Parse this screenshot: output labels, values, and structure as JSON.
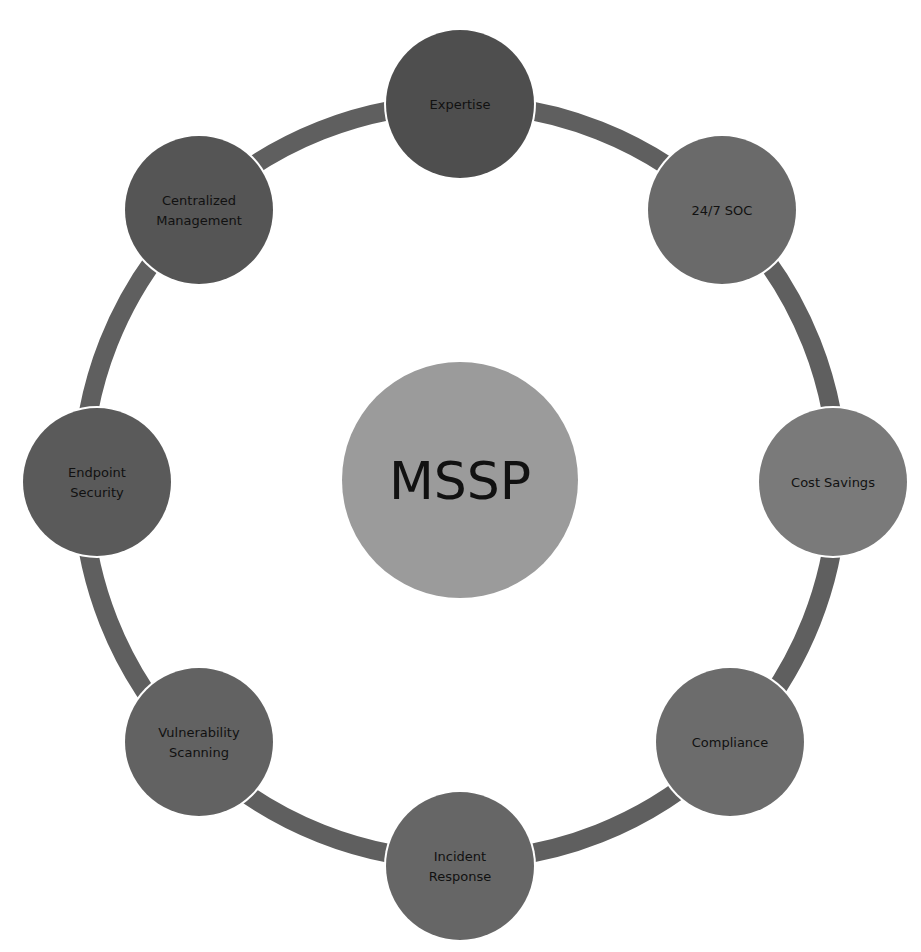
{
  "diagram": {
    "type": "hub-and-ring",
    "center": {
      "label": "MSSP",
      "color": "#9b9b9b"
    },
    "ring": {
      "color": "#5f5f5f"
    },
    "nodes": [
      {
        "id": "expertise",
        "lines": [
          "Expertise"
        ],
        "color": "#4e4e4e"
      },
      {
        "id": "soc",
        "lines": [
          "24/7 SOC"
        ],
        "color": "#6a6a6a"
      },
      {
        "id": "cost-savings",
        "lines": [
          "Cost Savings"
        ],
        "color": "#7a7a7a"
      },
      {
        "id": "compliance",
        "lines": [
          "Compliance"
        ],
        "color": "#6c6c6c"
      },
      {
        "id": "incident-response",
        "lines": [
          "Incident",
          "Response"
        ],
        "color": "#666666"
      },
      {
        "id": "vulnerability-scanning",
        "lines": [
          "Vulnerability",
          "Scanning"
        ],
        "color": "#626262"
      },
      {
        "id": "endpoint-security",
        "lines": [
          "Endpoint",
          "Security"
        ],
        "color": "#5a5a5a"
      },
      {
        "id": "centralized-management",
        "lines": [
          "Centralized",
          "Management"
        ],
        "color": "#555555"
      }
    ]
  }
}
